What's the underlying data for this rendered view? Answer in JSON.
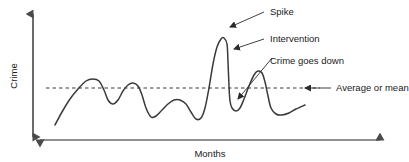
{
  "figure": {
    "type": "line-diagram",
    "axes": {
      "y_label": "Crime",
      "x_label": "Months"
    },
    "annotations": {
      "spike": "Spike",
      "intervention": "Intervention",
      "crime_goes_down": "Crime goes down",
      "average": "Average or mean"
    },
    "colors": {
      "line": "#3a3a3a",
      "axis": "#5a5a5a",
      "text": "#1a1a1a",
      "mean_line": "#3a3a3a",
      "background": "#ffffff"
    }
  },
  "chart_data": {
    "type": "line",
    "title": "",
    "xlabel": "Months",
    "ylabel": "Crime",
    "grid": false,
    "legend": false,
    "mean_level": 88,
    "annotations": [
      {
        "label": "Spike",
        "target_x": 228,
        "target_y": 28,
        "text_x": 268,
        "text_y": 15
      },
      {
        "label": "Intervention",
        "target_x": 232,
        "target_y": 50,
        "text_x": 268,
        "text_y": 42
      },
      {
        "label": "Crime goes down",
        "target_x": 236,
        "target_y": 100,
        "text_x": 268,
        "text_y": 64
      },
      {
        "label": "Average or mean",
        "target_x": 303,
        "target_y": 88,
        "text_x": 336,
        "text_y": 91
      }
    ],
    "series": [
      {
        "name": "Crime rate",
        "points": [
          [
            55,
            125
          ],
          [
            62,
            112
          ],
          [
            70,
            99
          ],
          [
            78,
            89
          ],
          [
            86,
            81
          ],
          [
            93,
            79
          ],
          [
            99,
            81
          ],
          [
            104,
            90
          ],
          [
            108,
            100
          ],
          [
            113,
            104
          ],
          [
            118,
            100
          ],
          [
            123,
            91
          ],
          [
            128,
            85
          ],
          [
            133,
            83
          ],
          [
            138,
            86
          ],
          [
            142,
            95
          ],
          [
            146,
            108
          ],
          [
            151,
            117
          ],
          [
            156,
            116
          ],
          [
            162,
            110
          ],
          [
            168,
            104
          ],
          [
            174,
            100
          ],
          [
            180,
            100
          ],
          [
            186,
            104
          ],
          [
            191,
            112
          ],
          [
            196,
            119
          ],
          [
            201,
            118
          ],
          [
            205,
            108
          ],
          [
            209,
            88
          ],
          [
            213,
            64
          ],
          [
            217,
            47
          ],
          [
            221,
            39
          ],
          [
            224,
            38
          ],
          [
            227,
            44
          ],
          [
            228,
            62
          ],
          [
            229,
            86
          ],
          [
            230,
            101
          ],
          [
            232,
            108
          ],
          [
            236,
            111
          ],
          [
            240,
            108
          ],
          [
            244,
            99
          ],
          [
            249,
            86
          ],
          [
            254,
            75
          ],
          [
            258,
            71
          ],
          [
            262,
            73
          ],
          [
            265,
            82
          ],
          [
            268,
            96
          ],
          [
            271,
            108
          ],
          [
            276,
            114
          ],
          [
            282,
            115
          ],
          [
            289,
            113
          ],
          [
            296,
            109
          ],
          [
            305,
            105
          ]
        ]
      }
    ]
  }
}
